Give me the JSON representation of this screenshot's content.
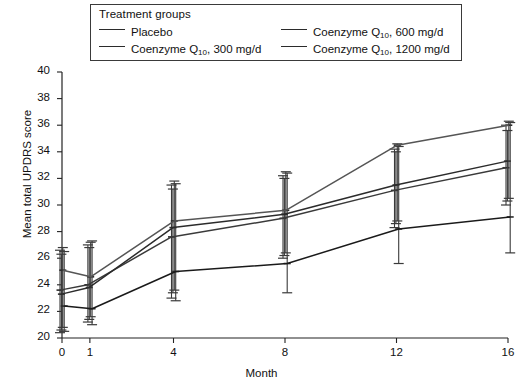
{
  "legend": {
    "title": "Treatment groups",
    "entries": [
      {
        "label": "Placebo",
        "sub": "",
        "suffix": "",
        "color": "#3a3a3a"
      },
      {
        "label": "Coenzyme  Q",
        "sub": "10",
        "suffix": ", 600 mg/d",
        "color": "#2b2b2b"
      },
      {
        "label": "Coenzyme  Q",
        "sub": "10",
        "suffix": ", 300 mg/d",
        "color": "#555555"
      },
      {
        "label": "Coenzyme  Q",
        "sub": "10",
        "suffix": ", 1200 mg/d",
        "color": "#1a1a1a"
      }
    ]
  },
  "axes": {
    "ylabel": "Mean total UPDRS score",
    "xlabel": "Month",
    "yticks": [
      "40",
      "38",
      "36",
      "34",
      "32",
      "30",
      "28",
      "26",
      "24",
      "22",
      "20"
    ],
    "xticks": [
      "0",
      "1",
      "4",
      "8",
      "12",
      "16"
    ]
  },
  "chart_data": {
    "type": "line",
    "title": "",
    "xlabel": "Month",
    "ylabel": "Mean total UPDRS score",
    "xlim": [
      0,
      16
    ],
    "ylim": [
      20,
      40
    ],
    "ytick_values": [
      20,
      22,
      24,
      26,
      28,
      30,
      32,
      34,
      36,
      38,
      40
    ],
    "xtick_values": [
      0,
      1,
      4,
      8,
      12,
      16
    ],
    "grid": false,
    "legend_position": "top-inside-box",
    "error_bars": "vertical, capped",
    "x": [
      0,
      1,
      4,
      8,
      12,
      16
    ],
    "series": [
      {
        "name": "Placebo",
        "values": [
          23.6,
          24.0,
          27.6,
          29.0,
          31.1,
          32.8
        ],
        "err_low": [
          20.4,
          21.2,
          23.0,
          26.0,
          28.3,
          30.0
        ],
        "err_high": [
          26.6,
          27.0,
          31.5,
          32.2,
          34.2,
          36.0
        ]
      },
      {
        "name": "Coenzyme Q10, 300 mg/d",
        "values": [
          23.3,
          23.8,
          28.3,
          29.3,
          31.5,
          33.3
        ],
        "err_low": [
          20.6,
          21.4,
          23.4,
          26.2,
          28.6,
          30.3
        ],
        "err_high": [
          26.3,
          26.8,
          31.2,
          32.0,
          34.0,
          35.6
        ]
      },
      {
        "name": "Coenzyme Q10, 600 mg/d",
        "values": [
          25.1,
          24.6,
          28.8,
          29.6,
          34.5,
          36.0
        ],
        "err_low": [
          20.8,
          21.6,
          23.6,
          26.4,
          28.8,
          30.5
        ],
        "err_high": [
          26.8,
          27.2,
          31.8,
          32.5,
          34.6,
          36.3
        ]
      },
      {
        "name": "Coenzyme Q10, 1200 mg/d",
        "values": [
          22.4,
          22.2,
          25.0,
          25.6,
          28.2,
          29.1
        ],
        "err_low": [
          20.5,
          21.0,
          22.8,
          23.4,
          25.6,
          26.4
        ],
        "err_high": [
          26.5,
          27.3,
          31.6,
          32.4,
          34.4,
          36.2
        ]
      }
    ]
  }
}
